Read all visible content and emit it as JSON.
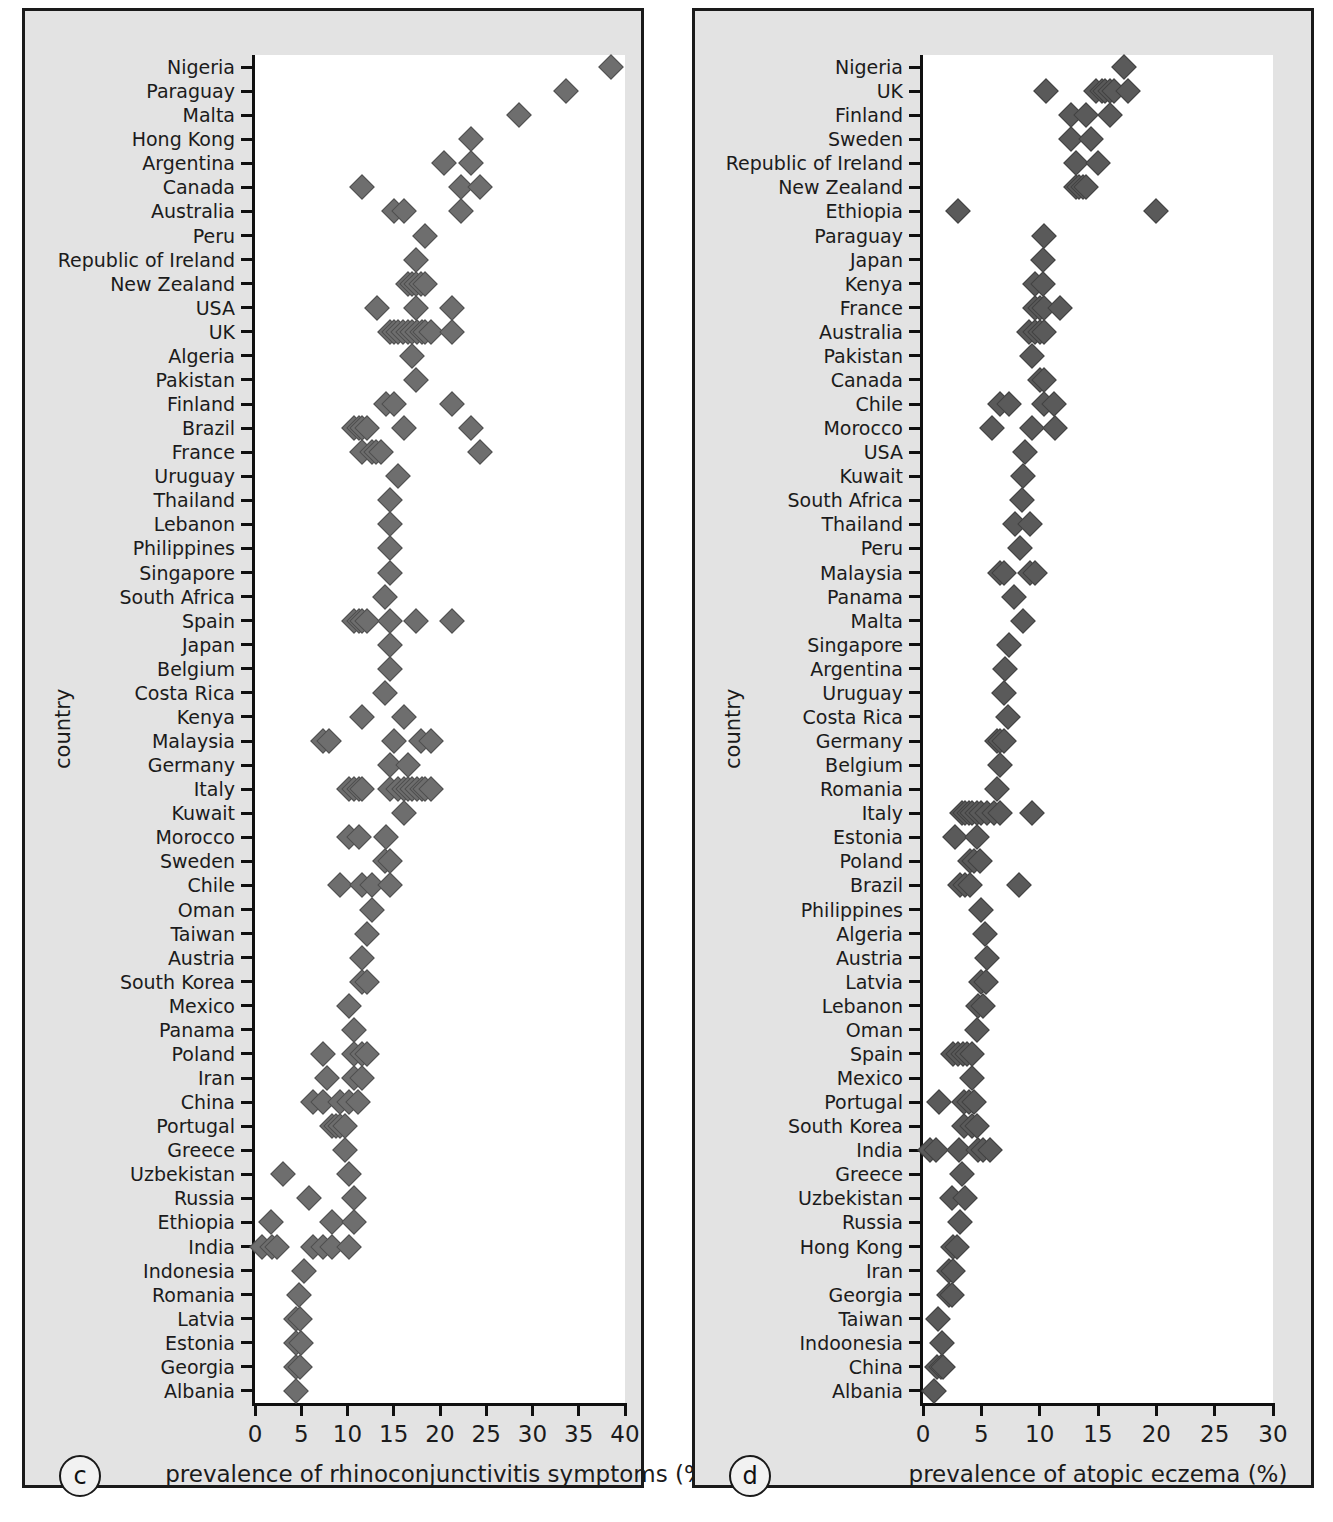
{
  "figure": {
    "background": "#e3e3e3",
    "plot_background": "#ffffff",
    "marker_color_c": "#6e6e6e",
    "marker_color_d": "#5a5a5a"
  },
  "panels": {
    "c": {
      "tag": "c",
      "axis_title_x": "prevalence of rhinoconjunctivitis symptoms (%)",
      "axis_title_y": "country"
    },
    "d": {
      "tag": "d",
      "axis_title_x": "prevalence of atopic eczema (%)",
      "axis_title_y": "country"
    }
  },
  "chart_data": [
    {
      "type": "scatter",
      "panel": "c",
      "title": "",
      "xlabel": "prevalence of rhinoconjunctivitis symptoms (%)",
      "ylabel": "country",
      "xlim": [
        0,
        40
      ],
      "xticks": [
        0,
        5,
        10,
        15,
        20,
        25,
        30,
        35,
        40
      ],
      "grid": false,
      "legend": "none",
      "categories": [
        "Nigeria",
        "Paraguay",
        "Malta",
        "Hong Kong",
        "Argentina",
        "Canada",
        "Australia",
        "Peru",
        "Republic of Ireland",
        "New Zealand",
        "USA",
        "UK",
        "Algeria",
        "Pakistan",
        "Finland",
        "Brazil",
        "France",
        "Uruguay",
        "Thailand",
        "Lebanon",
        "Philippines",
        "Singapore",
        "South Africa",
        "Spain",
        "Japan",
        "Belgium",
        "Costa Rica",
        "Kenya",
        "Malaysia",
        "Germany",
        "Italy",
        "Kuwait",
        "Morocco",
        "Sweden",
        "Chile",
        "Oman",
        "Taiwan",
        "Austria",
        "South Korea",
        "Mexico",
        "Panama",
        "Poland",
        "Iran",
        "China",
        "Portugal",
        "Greece",
        "Uzbekistan",
        "Russia",
        "Ethiopia",
        "India",
        "Indonesia",
        "Romania",
        "Latvia",
        "Estonia",
        "Georgia",
        "Albania"
      ],
      "values": [
        [
          38.5
        ],
        [
          33.6
        ],
        [
          28.5
        ],
        [
          23.3
        ],
        [
          20.4,
          23.3
        ],
        [
          11.6,
          22.3,
          24.3
        ],
        [
          15.0,
          16.1,
          22.3
        ],
        [
          18.4
        ],
        [
          17.4
        ],
        [
          16.5,
          17.0,
          17.4,
          17.9,
          18.4
        ],
        [
          13.2,
          17.4,
          21.3
        ],
        [
          14.6,
          15.0,
          15.5,
          16.0,
          16.5,
          17.0,
          17.5,
          18.0,
          18.4,
          19.0,
          21.3
        ],
        [
          17.0
        ],
        [
          17.4
        ],
        [
          14.2,
          15.0,
          21.3
        ],
        [
          10.7,
          11.2,
          11.6,
          12.1,
          16.1,
          23.3
        ],
        [
          11.6,
          12.6,
          13.1,
          13.6,
          24.3
        ],
        [
          15.5
        ],
        [
          14.6
        ],
        [
          14.6
        ],
        [
          14.6
        ],
        [
          14.6
        ],
        [
          14.1
        ],
        [
          10.7,
          11.2,
          11.6,
          12.1,
          14.6,
          17.4,
          21.3
        ],
        [
          14.6
        ],
        [
          14.6
        ],
        [
          14.1
        ],
        [
          11.6,
          16.1
        ],
        [
          7.3,
          8.0,
          15.0,
          17.9,
          19.0
        ],
        [
          14.6,
          16.5
        ],
        [
          10.2,
          10.7,
          11.2,
          11.6,
          14.6,
          15.5,
          16.1,
          16.5,
          17.0,
          17.5,
          18.0,
          18.4,
          19.0
        ],
        [
          16.1
        ],
        [
          10.2,
          11.2,
          14.2
        ],
        [
          14.1,
          14.6
        ],
        [
          9.2,
          11.6,
          12.6,
          14.6
        ],
        [
          12.6
        ],
        [
          12.1
        ],
        [
          11.6
        ],
        [
          11.6,
          12.1
        ],
        [
          10.2
        ],
        [
          10.7
        ],
        [
          7.3,
          10.7,
          11.6,
          12.1
        ],
        [
          7.8,
          10.7,
          11.6
        ],
        [
          6.3,
          7.3,
          9.2,
          10.2,
          11.1
        ],
        [
          8.3,
          8.8,
          9.2,
          9.7
        ],
        [
          9.7
        ],
        [
          3.0,
          10.2
        ],
        [
          5.8,
          10.7
        ],
        [
          1.7,
          8.3,
          10.7
        ],
        [
          0.8,
          1.8,
          2.4,
          6.3,
          7.3,
          8.3,
          10.2
        ],
        [
          5.3
        ],
        [
          4.8
        ],
        [
          4.4,
          4.9
        ],
        [
          4.4,
          5.0
        ],
        [
          4.4,
          4.9
        ],
        [
          4.4
        ]
      ]
    },
    {
      "type": "scatter",
      "panel": "d",
      "title": "",
      "xlabel": "prevalence of atopic eczema (%)",
      "ylabel": "country",
      "xlim": [
        0,
        30
      ],
      "xticks": [
        0,
        5,
        10,
        15,
        20,
        25,
        30
      ],
      "grid": false,
      "legend": "none",
      "categories": [
        "Nigeria",
        "UK",
        "Finland",
        "Sweden",
        "Republic of Ireland",
        "New Zealand",
        "Ethiopia",
        "Paraguay",
        "Japan",
        "Kenya",
        "France",
        "Australia",
        "Pakistan",
        "Canada",
        "Chile",
        "Morocco",
        "USA",
        "Kuwait",
        "South Africa",
        "Thailand",
        "Peru",
        "Malaysia",
        "Panama",
        "Malta",
        "Singapore",
        "Argentina",
        "Uruguay",
        "Costa Rica",
        "Germany",
        "Belgium",
        "Romania",
        "Italy",
        "Estonia",
        "Poland",
        "Brazil",
        "Philippines",
        "Algeria",
        "Austria",
        "Latvia",
        "Lebanon",
        "Oman",
        "Spain",
        "Mexico",
        "Portugal",
        "South Korea",
        "India",
        "Greece",
        "Uzbekistan",
        "Russia",
        "Hong Kong",
        "Iran",
        "Georgia",
        "Taiwan",
        "Indoonesia",
        "China",
        "Albania"
      ],
      "values": [
        [
          17.2
        ],
        [
          10.5,
          14.8,
          15.3,
          15.6,
          16.0,
          16.4,
          17.6
        ],
        [
          12.7,
          14.0,
          16.0
        ],
        [
          12.7,
          14.4
        ],
        [
          13.1,
          15.0
        ],
        [
          13.1,
          13.4,
          13.7,
          14.0
        ],
        [
          3.0,
          20.0
        ],
        [
          10.4
        ],
        [
          10.3
        ],
        [
          9.6,
          10.3
        ],
        [
          9.6,
          10.0,
          10.4,
          11.7
        ],
        [
          9.1,
          9.6,
          10.0,
          10.4
        ],
        [
          9.3
        ],
        [
          10.0,
          10.4
        ],
        [
          6.6,
          7.4,
          10.4,
          11.2
        ],
        [
          5.9,
          9.3,
          11.3
        ],
        [
          8.7
        ],
        [
          8.6
        ],
        [
          8.5
        ],
        [
          7.9,
          9.2
        ],
        [
          8.3
        ],
        [
          6.6,
          6.9,
          9.2,
          9.6
        ],
        [
          7.8
        ],
        [
          8.6
        ],
        [
          7.4
        ],
        [
          7.0
        ],
        [
          6.9
        ],
        [
          7.3
        ],
        [
          6.3,
          6.6,
          6.9
        ],
        [
          6.6
        ],
        [
          6.3
        ],
        [
          3.3,
          3.6,
          3.9,
          4.2,
          4.6,
          5.0,
          5.5,
          6.1,
          6.6,
          9.3
        ],
        [
          2.7,
          4.6
        ],
        [
          4.0,
          4.4,
          4.9
        ],
        [
          3.2,
          3.6,
          4.0,
          8.2
        ],
        [
          5.0
        ],
        [
          5.3
        ],
        [
          5.5
        ],
        [
          5.0,
          5.4
        ],
        [
          4.7,
          5.1
        ],
        [
          4.6
        ],
        [
          2.6,
          3.0,
          3.4,
          3.8,
          4.2
        ],
        [
          4.2
        ],
        [
          1.4,
          3.5,
          3.9,
          4.4
        ],
        [
          3.5,
          4.2,
          4.6
        ],
        [
          0.6,
          1.1,
          3.1,
          4.7,
          5.1,
          5.7
        ],
        [
          3.3
        ],
        [
          2.5,
          3.6
        ],
        [
          3.2
        ],
        [
          2.6,
          2.9
        ],
        [
          2.2,
          2.6
        ],
        [
          2.2,
          2.5
        ],
        [
          1.3
        ],
        [
          1.6
        ],
        [
          1.2,
          1.5,
          1.7
        ],
        [
          0.9
        ]
      ]
    }
  ]
}
